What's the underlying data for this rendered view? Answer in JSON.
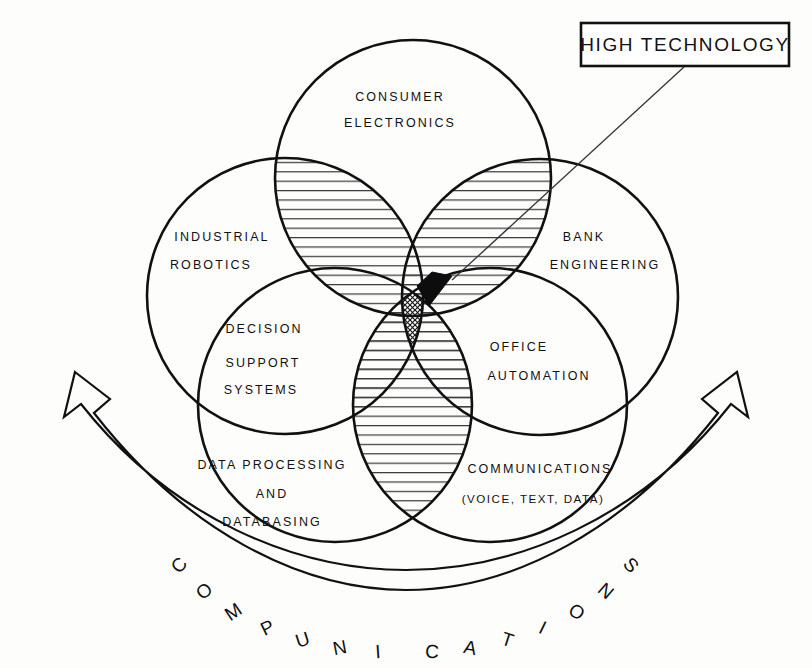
{
  "diagram": {
    "title_callout": "HIGH TECHNOLOGY",
    "band_label": "COMPUNICATIONS",
    "band_letters": [
      "C",
      "O",
      "M",
      "P",
      "U",
      "N",
      "I",
      "C",
      "A",
      "T",
      "I",
      "O",
      "N",
      "S"
    ],
    "colors": {
      "ink": "#111111",
      "background": "#fdfdfc",
      "hatch": "#333333",
      "solid_intersection": "#0d0d0d"
    },
    "circles": [
      {
        "id": "consumer-electronics",
        "lines": [
          "CONSUMER",
          "ELECTRONICS"
        ],
        "cx": 413,
        "cy": 178,
        "r": 138,
        "label_x": 400,
        "label_y": 98
      },
      {
        "id": "industrial-robotics",
        "lines": [
          "INDUSTRIAL",
          "ROBOTICS"
        ],
        "cx": 285,
        "cy": 296,
        "r": 138,
        "label_x": 222,
        "label_y": 238
      },
      {
        "id": "bank-engineering",
        "lines": [
          "BANK",
          "ENGINEERING"
        ],
        "cx": 540,
        "cy": 297,
        "r": 138,
        "label_x": 600,
        "label_y": 238
      },
      {
        "id": "decision-support-systems",
        "lines": [
          "DECISION",
          "SUPPORT",
          "SYSTEMS"
        ],
        "cx": 335,
        "cy": 405,
        "r": 137,
        "label_x": 264,
        "label_y": 330
      },
      {
        "id": "office-automation",
        "lines": [
          "OFFICE",
          "AUTOMATION"
        ],
        "cx": 490,
        "cy": 405,
        "r": 137,
        "label_x": 545,
        "label_y": 348
      }
    ],
    "extra_labels": [
      {
        "id": "data-processing-and-databasing",
        "lines": [
          "DATA PROCESSING",
          "AND",
          "DATABASING"
        ],
        "label_x": 272,
        "label_y": 466
      },
      {
        "id": "communications-voice-text-data",
        "lines": [
          "COMMUNICATIONS",
          "(VOICE, TEXT, DATA)"
        ],
        "label_x": 537,
        "label_y": 470
      }
    ]
  }
}
